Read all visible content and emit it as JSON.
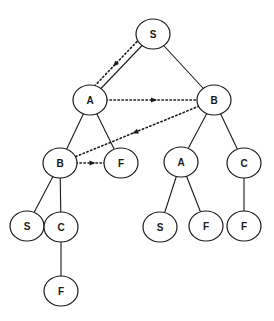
{
  "diagram": {
    "type": "search-tree",
    "nodes": [
      {
        "id": "n1",
        "label": "S",
        "x": 153,
        "y": 34
      },
      {
        "id": "n2",
        "label": "A",
        "x": 90,
        "y": 100
      },
      {
        "id": "n3",
        "label": "B",
        "x": 214,
        "y": 100
      },
      {
        "id": "n4",
        "label": "B",
        "x": 60,
        "y": 163
      },
      {
        "id": "n5",
        "label": "F",
        "x": 121,
        "y": 163
      },
      {
        "id": "n6",
        "label": "A",
        "x": 181,
        "y": 162
      },
      {
        "id": "n7",
        "label": "C",
        "x": 244,
        "y": 163
      },
      {
        "id": "n8",
        "label": "S",
        "x": 27,
        "y": 226
      },
      {
        "id": "n9",
        "label": "C",
        "x": 61,
        "y": 227
      },
      {
        "id": "n10",
        "label": "S",
        "x": 160,
        "y": 227
      },
      {
        "id": "n11",
        "label": "F",
        "x": 206,
        "y": 226
      },
      {
        "id": "n12",
        "label": "F",
        "x": 244,
        "y": 226
      },
      {
        "id": "n13",
        "label": "F",
        "x": 61,
        "y": 291
      }
    ],
    "edges": [
      [
        "n1",
        "n2"
      ],
      [
        "n1",
        "n3"
      ],
      [
        "n2",
        "n4"
      ],
      [
        "n2",
        "n5"
      ],
      [
        "n3",
        "n6"
      ],
      [
        "n3",
        "n7"
      ],
      [
        "n4",
        "n8"
      ],
      [
        "n4",
        "n9"
      ],
      [
        "n6",
        "n10"
      ],
      [
        "n6",
        "n11"
      ],
      [
        "n7",
        "n12"
      ],
      [
        "n9",
        "n13"
      ]
    ],
    "traversal": [
      "n1",
      "n2",
      "n3",
      "n4",
      "n5"
    ]
  }
}
